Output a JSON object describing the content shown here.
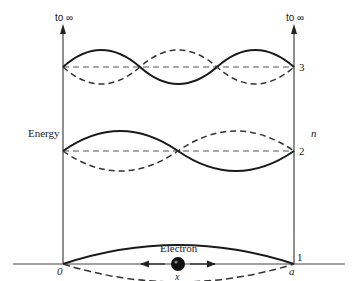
{
  "diagram": {
    "type": "energy-level diagram",
    "axis_labels": {
      "left_top": "to ∞",
      "right_top": "to ∞",
      "energy": "Energy",
      "quantum_number": "n"
    },
    "levels": [
      {
        "n": "1",
        "antinodes": 1
      },
      {
        "n": "2",
        "antinodes": 2
      },
      {
        "n": "3",
        "antinodes": 3
      }
    ],
    "baseline": {
      "left_label": "0",
      "right_label": "a",
      "axis_label": "x"
    },
    "particle": {
      "label": "Electron",
      "icon": "electron-dot-icon",
      "motion": "bidirectional-arrow-icon"
    },
    "colors": {
      "line": "#1a1a1a",
      "dashed": "#333333",
      "axis": "#444444",
      "background": "#ffffff"
    }
  }
}
